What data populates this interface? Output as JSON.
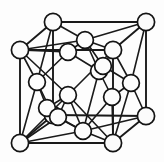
{
  "figure": {
    "type": "crystal-lattice-diagram",
    "width": 164,
    "height": 162,
    "background_color": "#fdfdfd",
    "line_color": "#1a1a1a",
    "atom_fill_color": "#fbfbfb",
    "atom_stroke_color": "#141414",
    "atom_radius": 8.2,
    "atom_count": 19,
    "bond_count": 44
  },
  "atoms": [
    {
      "id": "corner-back-top-left",
      "name": "corner-atom-back-top-left",
      "x": 53,
      "y": 22,
      "r": 8.6,
      "kind": "corner"
    },
    {
      "id": "corner-back-top-right",
      "name": "corner-atom-back-top-right",
      "x": 146,
      "y": 22,
      "r": 8.6,
      "kind": "corner"
    },
    {
      "id": "corner-front-top-left",
      "name": "corner-atom-front-top-left",
      "x": 20,
      "y": 50,
      "r": 8.6,
      "kind": "corner"
    },
    {
      "id": "corner-front-top-right",
      "name": "corner-atom-front-top-right",
      "x": 113,
      "y": 50,
      "r": 8.6,
      "kind": "corner"
    },
    {
      "id": "corner-back-bottom-left",
      "name": "corner-atom-back-bottom-left",
      "x": 53,
      "y": 115,
      "r": 8.6,
      "kind": "corner"
    },
    {
      "id": "corner-back-bottom-right",
      "name": "corner-atom-back-bottom-right",
      "x": 146,
      "y": 116,
      "r": 8.6,
      "kind": "corner"
    },
    {
      "id": "corner-front-bottom-left",
      "name": "corner-atom-front-bottom-left",
      "x": 20,
      "y": 143,
      "r": 8.6,
      "kind": "corner"
    },
    {
      "id": "corner-front-bottom-right",
      "name": "corner-atom-front-bottom-right",
      "x": 113,
      "y": 143,
      "r": 8.6,
      "kind": "corner"
    },
    {
      "id": "face-top",
      "name": "face-center-atom-top",
      "x": 85,
      "y": 40,
      "r": 8.4,
      "kind": "face"
    },
    {
      "id": "face-left",
      "name": "face-center-atom-left",
      "x": 37,
      "y": 82,
      "r": 8.4,
      "kind": "face"
    },
    {
      "id": "face-right",
      "name": "face-center-atom-right",
      "x": 131,
      "y": 83,
      "r": 8.4,
      "kind": "face"
    },
    {
      "id": "face-bottom",
      "name": "face-center-atom-bottom",
      "x": 83,
      "y": 131,
      "r": 8.4,
      "kind": "face"
    },
    {
      "id": "face-front",
      "name": "face-center-atom-front",
      "x": 68,
      "y": 95,
      "r": 8.4,
      "kind": "face"
    },
    {
      "id": "face-back",
      "name": "face-center-atom-back",
      "x": 99,
      "y": 71,
      "r": 8.4,
      "kind": "face"
    },
    {
      "id": "tetra-upper-left",
      "name": "tetrahedral-atom-upper-left",
      "x": 68,
      "y": 52,
      "r": 8.4,
      "kind": "tetrahedral"
    },
    {
      "id": "tetra-upper-right",
      "name": "tetrahedral-atom-upper-right",
      "x": 103,
      "y": 66,
      "r": 8.4,
      "kind": "tetrahedral"
    },
    {
      "id": "tetra-lower-right",
      "name": "tetrahedral-atom-lower-right",
      "x": 112,
      "y": 97,
      "r": 8.4,
      "kind": "tetrahedral"
    },
    {
      "id": "tetra-lower-left",
      "name": "tetrahedral-atom-lower-left",
      "x": 47,
      "y": 108,
      "r": 8.4,
      "kind": "tetrahedral"
    },
    {
      "id": "tetra-inner-low",
      "name": "tetrahedral-atom-inner-lower",
      "x": 58,
      "y": 117,
      "r": 8.4,
      "kind": "tetrahedral"
    }
  ],
  "bonds": [
    {
      "name": "cube-edge-top-back",
      "from": "corner-back-top-left",
      "to": "corner-back-top-right",
      "style": "cube-edge"
    },
    {
      "name": "cube-edge-top-left",
      "from": "corner-back-top-left",
      "to": "corner-front-top-left",
      "style": "cube-edge"
    },
    {
      "name": "cube-edge-top-right",
      "from": "corner-back-top-right",
      "to": "corner-front-top-right",
      "style": "cube-edge"
    },
    {
      "name": "cube-edge-top-front",
      "from": "corner-front-top-left",
      "to": "corner-front-top-right",
      "style": "cube-edge"
    },
    {
      "name": "cube-edge-vertical-bl",
      "from": "corner-back-top-left",
      "to": "corner-back-bottom-left",
      "style": "cube-edge"
    },
    {
      "name": "cube-edge-vertical-br",
      "from": "corner-back-top-right",
      "to": "corner-back-bottom-right",
      "style": "cube-edge"
    },
    {
      "name": "cube-edge-vertical-fl",
      "from": "corner-front-top-left",
      "to": "corner-front-bottom-left",
      "style": "cube-edge"
    },
    {
      "name": "cube-edge-vertical-fr",
      "from": "corner-front-top-right",
      "to": "corner-front-bottom-right",
      "style": "cube-edge"
    },
    {
      "name": "cube-edge-bottom-back",
      "from": "corner-back-bottom-left",
      "to": "corner-back-bottom-right",
      "style": "cube-edge"
    },
    {
      "name": "cube-edge-bottom-left",
      "from": "corner-back-bottom-left",
      "to": "corner-front-bottom-left",
      "style": "cube-edge"
    },
    {
      "name": "cube-edge-bottom-right",
      "from": "corner-back-bottom-right",
      "to": "corner-front-bottom-right",
      "style": "cube-edge"
    },
    {
      "name": "cube-edge-bottom-front",
      "from": "corner-front-bottom-left",
      "to": "corner-front-bottom-right",
      "style": "cube-edge"
    },
    {
      "name": "face-bond-top-btl",
      "from": "face-top",
      "to": "corner-back-top-left",
      "style": "bond"
    },
    {
      "name": "face-bond-top-btr",
      "from": "face-top",
      "to": "corner-back-top-right",
      "style": "bond"
    },
    {
      "name": "face-bond-top-ftl",
      "from": "face-top",
      "to": "corner-front-top-left",
      "style": "bond"
    },
    {
      "name": "face-bond-top-ftr",
      "from": "face-top",
      "to": "corner-front-top-right",
      "style": "bond"
    },
    {
      "name": "face-bond-left-btl",
      "from": "face-left",
      "to": "corner-back-top-left",
      "style": "bond"
    },
    {
      "name": "face-bond-left-ftl",
      "from": "face-left",
      "to": "corner-front-top-left",
      "style": "bond"
    },
    {
      "name": "face-bond-left-bbl",
      "from": "face-left",
      "to": "corner-back-bottom-left",
      "style": "bond"
    },
    {
      "name": "face-bond-left-fbl",
      "from": "face-left",
      "to": "corner-front-bottom-left",
      "style": "bond"
    },
    {
      "name": "face-bond-right-btr",
      "from": "face-right",
      "to": "corner-back-top-right",
      "style": "bond"
    },
    {
      "name": "face-bond-right-ftr",
      "from": "face-right",
      "to": "corner-front-top-right",
      "style": "bond"
    },
    {
      "name": "face-bond-right-bbr",
      "from": "face-right",
      "to": "corner-back-bottom-right",
      "style": "bond"
    },
    {
      "name": "face-bond-right-fbr",
      "from": "face-right",
      "to": "corner-front-bottom-right",
      "style": "bond"
    },
    {
      "name": "face-bond-bottom-bbl",
      "from": "face-bottom",
      "to": "corner-back-bottom-left",
      "style": "bond"
    },
    {
      "name": "face-bond-bottom-bbr",
      "from": "face-bottom",
      "to": "corner-back-bottom-right",
      "style": "bond"
    },
    {
      "name": "face-bond-bottom-fbl",
      "from": "face-bottom",
      "to": "corner-front-bottom-left",
      "style": "bond"
    },
    {
      "name": "face-bond-bottom-fbr",
      "from": "face-bottom",
      "to": "corner-front-bottom-right",
      "style": "bond"
    },
    {
      "name": "face-bond-front-ftl",
      "from": "face-front",
      "to": "corner-front-top-left",
      "style": "bond"
    },
    {
      "name": "face-bond-front-ftr",
      "from": "face-front",
      "to": "corner-front-top-right",
      "style": "bond"
    },
    {
      "name": "face-bond-front-fbl",
      "from": "face-front",
      "to": "corner-front-bottom-left",
      "style": "bond"
    },
    {
      "name": "face-bond-front-fbr",
      "from": "face-front",
      "to": "corner-front-bottom-right",
      "style": "bond"
    },
    {
      "name": "tetra-bond-ul-top",
      "from": "tetra-upper-left",
      "to": "face-top",
      "style": "bond"
    },
    {
      "name": "tetra-bond-ul-ftl",
      "from": "tetra-upper-left",
      "to": "corner-front-top-left",
      "style": "bond"
    },
    {
      "name": "tetra-bond-ul-left",
      "from": "tetra-upper-left",
      "to": "face-left",
      "style": "bond"
    },
    {
      "name": "tetra-bond-ul-back",
      "from": "tetra-upper-left",
      "to": "face-back",
      "style": "bond"
    },
    {
      "name": "tetra-bond-ur-top",
      "from": "tetra-upper-right",
      "to": "face-top",
      "style": "bond"
    },
    {
      "name": "tetra-bond-ur-ftr",
      "from": "tetra-upper-right",
      "to": "corner-front-top-right",
      "style": "bond"
    },
    {
      "name": "tetra-bond-ur-right",
      "from": "tetra-upper-right",
      "to": "face-right",
      "style": "bond"
    },
    {
      "name": "tetra-bond-ur-back",
      "from": "tetra-upper-right",
      "to": "face-back",
      "style": "bond"
    },
    {
      "name": "tetra-bond-lr-right",
      "from": "tetra-lower-right",
      "to": "face-right",
      "style": "bond"
    },
    {
      "name": "tetra-bond-lr-back",
      "from": "tetra-lower-right",
      "to": "face-back",
      "style": "bond"
    },
    {
      "name": "tetra-bond-lr-bottom",
      "from": "tetra-lower-right",
      "to": "face-bottom",
      "style": "bond"
    },
    {
      "name": "tetra-bond-lr-fbr",
      "from": "tetra-lower-right",
      "to": "corner-front-bottom-right",
      "style": "bond"
    },
    {
      "name": "tetra-bond-ll-left",
      "from": "tetra-lower-left",
      "to": "face-left",
      "style": "bond"
    },
    {
      "name": "tetra-bond-ll-front",
      "from": "tetra-lower-left",
      "to": "face-front",
      "style": "bond"
    },
    {
      "name": "tetra-bond-ll-bbl",
      "from": "tetra-lower-left",
      "to": "corner-back-bottom-left",
      "style": "bond"
    },
    {
      "name": "tetra-bond-il-bottom",
      "from": "tetra-inner-low",
      "to": "face-bottom",
      "style": "bond"
    },
    {
      "name": "tetra-bond-il-fbl",
      "from": "tetra-inner-low",
      "to": "corner-front-bottom-left",
      "style": "bond"
    },
    {
      "name": "tetra-bond-il-front",
      "from": "tetra-inner-low",
      "to": "face-front",
      "style": "bond"
    },
    {
      "name": "tetra-bond-back-top",
      "from": "face-back",
      "to": "face-top",
      "style": "bond"
    },
    {
      "name": "tetra-bond-back-bottom",
      "from": "face-back",
      "to": "face-bottom",
      "style": "bond"
    },
    {
      "name": "tetra-bond-front-bottom",
      "from": "face-front",
      "to": "face-bottom",
      "style": "bond"
    }
  ]
}
